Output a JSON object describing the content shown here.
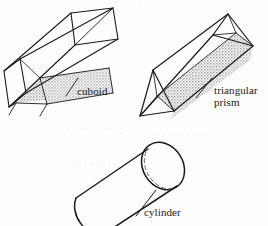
{
  "figure": {
    "background_color": "#fdfdfc",
    "ink_color": "#1a1a1a",
    "shade_color": "#b9b9b9",
    "labels": {
      "cuboid": "cuboid",
      "prism_line1": "triangular",
      "prism_line2": "prism",
      "cylinder": "cylinder"
    }
  },
  "shapes": [
    {
      "id": "cuboid",
      "name": "cuboid",
      "label": "cuboid",
      "description": "Long rectangular box in wireframe perspective, running from lower-left to upper-right, with the inner bottom face stippled.",
      "faces_shaded": [
        "inner-bottom"
      ],
      "hidden_edges": "visible (transparent wireframe)"
    },
    {
      "id": "triangular-prism",
      "name": "triangular prism",
      "label_line1": "triangular",
      "label_line2": "prism",
      "description": "Long prism with triangular cross-section running lower-left to upper-right, one long rectangular face stippled.",
      "faces_shaded": [
        "front-right-rectangular"
      ],
      "hidden_edges": "visible (transparent wireframe)"
    },
    {
      "id": "cylinder",
      "name": "cylinder",
      "label": "cylinder",
      "description": "Tilted circular tube running lower-left to upper-right; far end cap drawn as ellipse with dashed hidden arc; near end partially cropped by the image edge.",
      "faces_shaded": [],
      "hidden_edges": "dashed arc on near side of far end cap"
    }
  ],
  "scan_artifacts": {
    "present": true,
    "description": "Faint bleed-through marks from the reverse side of the page near the top edge and mid-page."
  }
}
